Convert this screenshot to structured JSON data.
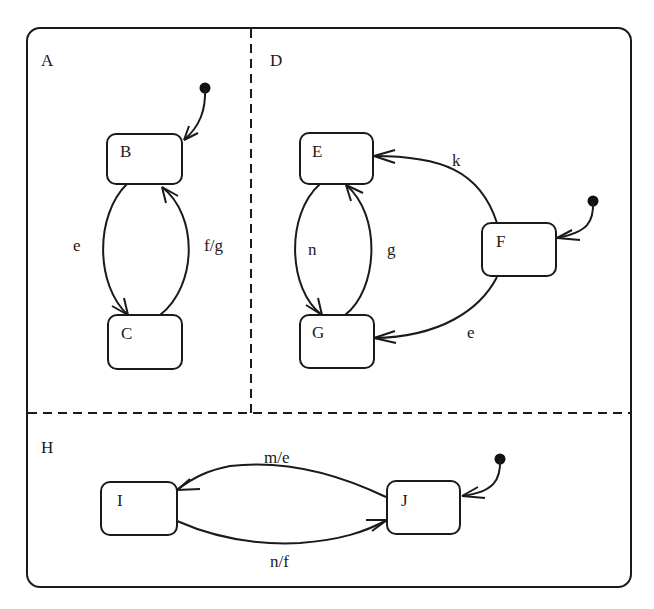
{
  "diagram": {
    "type": "statechart",
    "colors": {
      "line": "#1a1a1a",
      "background": "#ffffff"
    },
    "regions": [
      {
        "id": "A",
        "label": "A"
      },
      {
        "id": "D",
        "label": "D"
      },
      {
        "id": "H",
        "label": "H"
      }
    ],
    "states": [
      {
        "id": "B",
        "label": "B",
        "region": "A",
        "initial": true
      },
      {
        "id": "C",
        "label": "C",
        "region": "A"
      },
      {
        "id": "E",
        "label": "E",
        "region": "D"
      },
      {
        "id": "F",
        "label": "F",
        "region": "D",
        "initial": true
      },
      {
        "id": "G",
        "label": "G",
        "region": "D"
      },
      {
        "id": "I",
        "label": "I",
        "region": "H"
      },
      {
        "id": "J",
        "label": "J",
        "region": "H",
        "initial": true
      }
    ],
    "transitions": [
      {
        "from": "B",
        "to": "C",
        "label": "e"
      },
      {
        "from": "C",
        "to": "B",
        "label": "f/g"
      },
      {
        "from": "F",
        "to": "E",
        "label": "k"
      },
      {
        "from": "F",
        "to": "G",
        "label": "e"
      },
      {
        "from": "E",
        "to": "G",
        "label": "n"
      },
      {
        "from": "G",
        "to": "E",
        "label": "g"
      },
      {
        "from": "J",
        "to": "I",
        "label": "m/e"
      },
      {
        "from": "I",
        "to": "J",
        "label": "n/f"
      }
    ],
    "labels": {
      "region_A": "A",
      "region_D": "D",
      "region_H": "H",
      "state_B": "B",
      "state_C": "C",
      "state_E": "E",
      "state_F": "F",
      "state_G": "G",
      "state_I": "I",
      "state_J": "J",
      "t_B_C": "e",
      "t_C_B": "f/g",
      "t_F_E": "k",
      "t_F_G": "e",
      "t_E_G": "n",
      "t_G_E": "g",
      "t_J_I": "m/e",
      "t_I_J": "n/f"
    }
  }
}
